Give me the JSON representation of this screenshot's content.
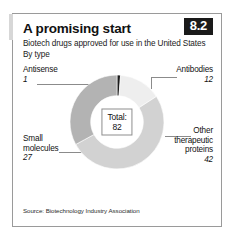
{
  "figure": {
    "number": "8.2",
    "title": "A promising start",
    "subtitle": "Biotech drugs approved for use in the United States",
    "unit_note": "By type",
    "source": "Source: Biotechnology Industry Association"
  },
  "center": {
    "total_label": "Total:",
    "total_value": "82"
  },
  "callouts": {
    "antisense": {
      "label": "Antisense",
      "value": "1"
    },
    "antibodies": {
      "label": "Antibodies",
      "value": "12"
    },
    "small_molecules": {
      "label_line1": "Small",
      "label_line2": "molecules",
      "value": "27"
    },
    "other_proteins": {
      "label_line1": "Other",
      "label_line2": "therapeutic",
      "label_line3": "proteins",
      "value": "42"
    }
  },
  "chart_data": {
    "type": "pie",
    "variant": "donut",
    "title": "A promising start",
    "subtitle": "Biotech drugs approved for use in the United States",
    "unit_note": "By type",
    "source": "Source: Biotechnology Industry Association",
    "total": 82,
    "total_label": "Total: 82",
    "categories": [
      "Antisense",
      "Antibodies",
      "Other therapeutic proteins",
      "Small molecules"
    ],
    "values": [
      1,
      12,
      42,
      27
    ],
    "colors": [
      "#1c1c1c",
      "#eeeeee",
      "#d2d2d2",
      "#b3b3b3"
    ],
    "start_angle_deg": 0,
    "direction": "clockwise",
    "inner_radius_ratio": 0.56,
    "legend": "callout-labels",
    "grid": false
  },
  "colors": {
    "antisense": "#1c1c1c",
    "antibodies": "#eeeeee",
    "other_proteins": "#d2d2d2",
    "small_molecules": "#b3b3b3",
    "frame": "#9a9a9a",
    "badge_bg": "#1a1a1a",
    "leader": "#8b8b8b"
  }
}
